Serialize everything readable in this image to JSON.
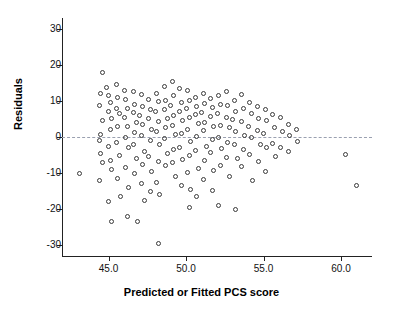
{
  "chart_data": {
    "type": "scatter",
    "title": "",
    "xlabel": "Predicted or Fitted PCS score",
    "ylabel": "Residuals",
    "xlim": [
      42.0,
      62.0
    ],
    "ylim": [
      -33.0,
      33.0
    ],
    "xticks": [
      45.0,
      50.0,
      55.0,
      60.0
    ],
    "xtick_labels": [
      "45.0",
      "50.0",
      "55.0",
      "60.0"
    ],
    "yticks": [
      -30,
      -20,
      -10,
      0,
      10,
      20,
      30
    ],
    "ytick_labels": [
      "-30",
      "-20",
      "-10",
      "0",
      "10",
      "20",
      "30"
    ],
    "grid": false,
    "legend": null,
    "reference_lines": [
      {
        "name": "zero-residual-line",
        "orientation": "horizontal",
        "y": 0,
        "style": "dashed",
        "color": "#9aa0b0"
      }
    ],
    "marker": {
      "shape": "open-circle",
      "color": "#3a3a3a",
      "size": 5
    },
    "points": [
      [
        43.1,
        -10.2
      ],
      [
        44.6,
        17.8
      ],
      [
        44.5,
        12.0
      ],
      [
        44.4,
        8.6
      ],
      [
        44.6,
        4.5
      ],
      [
        44.5,
        0.6
      ],
      [
        44.4,
        -1.0
      ],
      [
        44.5,
        -4.7
      ],
      [
        44.6,
        -7.0
      ],
      [
        44.4,
        -12.0
      ],
      [
        44.9,
        13.8
      ],
      [
        45.0,
        11.5
      ],
      [
        45.1,
        9.5
      ],
      [
        45.0,
        7.0
      ],
      [
        45.2,
        5.0
      ],
      [
        45.1,
        2.0
      ],
      [
        45.0,
        -2.5
      ],
      [
        45.1,
        -6.5
      ],
      [
        45.2,
        -9.0
      ],
      [
        45.0,
        -18.0
      ],
      [
        45.2,
        -23.5
      ],
      [
        45.5,
        14.5
      ],
      [
        45.6,
        11.0
      ],
      [
        45.5,
        8.0
      ],
      [
        45.7,
        6.5
      ],
      [
        45.6,
        3.0
      ],
      [
        45.5,
        -1.5
      ],
      [
        45.7,
        -5.0
      ],
      [
        45.6,
        -11.5
      ],
      [
        45.8,
        -16.5
      ],
      [
        46.0,
        13.0
      ],
      [
        46.1,
        10.5
      ],
      [
        46.2,
        7.8
      ],
      [
        46.0,
        5.5
      ],
      [
        46.2,
        2.8
      ],
      [
        46.1,
        0.0
      ],
      [
        46.3,
        -3.0
      ],
      [
        46.1,
        -8.5
      ],
      [
        46.3,
        -14.0
      ],
      [
        46.2,
        -22.0
      ],
      [
        46.6,
        12.5
      ],
      [
        46.7,
        9.0
      ],
      [
        46.6,
        6.8
      ],
      [
        46.8,
        4.0
      ],
      [
        46.7,
        1.2
      ],
      [
        46.6,
        -2.0
      ],
      [
        46.8,
        -6.0
      ],
      [
        46.7,
        -10.0
      ],
      [
        46.9,
        -23.5
      ],
      [
        47.1,
        11.8
      ],
      [
        47.2,
        8.5
      ],
      [
        47.0,
        6.0
      ],
      [
        47.2,
        3.5
      ],
      [
        47.1,
        0.5
      ],
      [
        47.3,
        -4.0
      ],
      [
        47.2,
        -7.5
      ],
      [
        47.1,
        -13.0
      ],
      [
        47.3,
        -17.5
      ],
      [
        47.6,
        10.5
      ],
      [
        47.7,
        7.5
      ],
      [
        47.6,
        5.2
      ],
      [
        47.8,
        2.0
      ],
      [
        47.7,
        -1.0
      ],
      [
        47.6,
        -5.5
      ],
      [
        47.8,
        -9.5
      ],
      [
        47.7,
        -15.0
      ],
      [
        48.1,
        12.0
      ],
      [
        48.2,
        9.8
      ],
      [
        48.0,
        7.0
      ],
      [
        48.2,
        4.2
      ],
      [
        48.1,
        1.5
      ],
      [
        48.3,
        -2.2
      ],
      [
        48.2,
        -6.8
      ],
      [
        48.1,
        -12.5
      ],
      [
        48.3,
        -16.0
      ],
      [
        48.2,
        -29.5
      ],
      [
        48.6,
        14.0
      ],
      [
        48.7,
        10.0
      ],
      [
        48.6,
        7.5
      ],
      [
        48.8,
        5.0
      ],
      [
        48.7,
        2.5
      ],
      [
        48.6,
        -0.5
      ],
      [
        48.8,
        -4.5
      ],
      [
        48.7,
        -8.0
      ],
      [
        49.1,
        15.5
      ],
      [
        49.2,
        11.5
      ],
      [
        49.0,
        8.8
      ],
      [
        49.2,
        6.0
      ],
      [
        49.1,
        3.2
      ],
      [
        49.3,
        0.8
      ],
      [
        49.2,
        -3.5
      ],
      [
        49.1,
        -7.2
      ],
      [
        49.3,
        -11.0
      ],
      [
        49.6,
        13.5
      ],
      [
        49.7,
        9.5
      ],
      [
        49.6,
        7.2
      ],
      [
        49.8,
        4.5
      ],
      [
        49.7,
        1.0
      ],
      [
        49.6,
        -2.8
      ],
      [
        49.8,
        -6.2
      ],
      [
        49.7,
        -13.5
      ],
      [
        50.1,
        12.8
      ],
      [
        50.2,
        10.2
      ],
      [
        50.0,
        8.0
      ],
      [
        50.2,
        5.5
      ],
      [
        50.1,
        2.2
      ],
      [
        50.3,
        -1.2
      ],
      [
        50.2,
        -5.0
      ],
      [
        50.1,
        -9.8
      ],
      [
        50.3,
        -14.5
      ],
      [
        50.2,
        -19.5
      ],
      [
        50.6,
        11.0
      ],
      [
        50.7,
        8.5
      ],
      [
        50.6,
        6.2
      ],
      [
        50.8,
        3.8
      ],
      [
        50.7,
        0.2
      ],
      [
        50.6,
        -3.8
      ],
      [
        50.8,
        -8.8
      ],
      [
        50.7,
        -16.5
      ],
      [
        51.1,
        12.2
      ],
      [
        51.2,
        9.2
      ],
      [
        51.0,
        6.8
      ],
      [
        51.2,
        4.0
      ],
      [
        51.1,
        1.8
      ],
      [
        51.3,
        -2.5
      ],
      [
        51.2,
        -6.5
      ],
      [
        51.1,
        -11.8
      ],
      [
        51.6,
        10.8
      ],
      [
        51.7,
        8.2
      ],
      [
        51.6,
        5.8
      ],
      [
        51.8,
        2.8
      ],
      [
        51.7,
        -0.8
      ],
      [
        51.6,
        -4.2
      ],
      [
        51.8,
        -9.2
      ],
      [
        51.7,
        -14.8
      ],
      [
        52.1,
        11.5
      ],
      [
        52.2,
        9.0
      ],
      [
        52.0,
        6.5
      ],
      [
        52.2,
        3.2
      ],
      [
        52.1,
        0.0
      ],
      [
        52.3,
        -3.2
      ],
      [
        52.2,
        -7.8
      ],
      [
        52.1,
        -19.0
      ],
      [
        52.6,
        12.5
      ],
      [
        52.7,
        8.8
      ],
      [
        52.6,
        5.5
      ],
      [
        52.8,
        2.5
      ],
      [
        52.7,
        -1.5
      ],
      [
        52.6,
        -5.8
      ],
      [
        52.8,
        -11.0
      ],
      [
        53.1,
        10.0
      ],
      [
        53.2,
        7.2
      ],
      [
        53.0,
        4.8
      ],
      [
        53.2,
        1.5
      ],
      [
        53.1,
        -2.0
      ],
      [
        53.3,
        -6.0
      ],
      [
        53.2,
        -20.0
      ],
      [
        53.6,
        11.8
      ],
      [
        53.7,
        8.0
      ],
      [
        53.6,
        4.2
      ],
      [
        53.8,
        0.5
      ],
      [
        53.7,
        -3.5
      ],
      [
        53.6,
        -8.2
      ],
      [
        54.1,
        9.5
      ],
      [
        54.2,
        6.5
      ],
      [
        54.0,
        3.0
      ],
      [
        54.2,
        -0.2
      ],
      [
        54.1,
        -4.8
      ],
      [
        54.3,
        -12.2
      ],
      [
        54.6,
        8.5
      ],
      [
        54.7,
        5.0
      ],
      [
        54.6,
        1.8
      ],
      [
        54.8,
        -2.2
      ],
      [
        54.7,
        -6.8
      ],
      [
        55.1,
        7.5
      ],
      [
        55.2,
        4.5
      ],
      [
        55.0,
        1.0
      ],
      [
        55.2,
        -3.0
      ],
      [
        55.1,
        -9.5
      ],
      [
        55.6,
        6.2
      ],
      [
        55.7,
        2.5
      ],
      [
        55.6,
        -1.8
      ],
      [
        55.8,
        -5.5
      ],
      [
        56.1,
        5.5
      ],
      [
        56.2,
        1.5
      ],
      [
        56.1,
        -2.8
      ],
      [
        56.6,
        3.5
      ],
      [
        56.7,
        0.5
      ],
      [
        56.6,
        -4.0
      ],
      [
        57.1,
        2.0
      ],
      [
        57.2,
        -1.2
      ],
      [
        60.3,
        -4.8
      ],
      [
        61.0,
        -13.5
      ]
    ]
  }
}
